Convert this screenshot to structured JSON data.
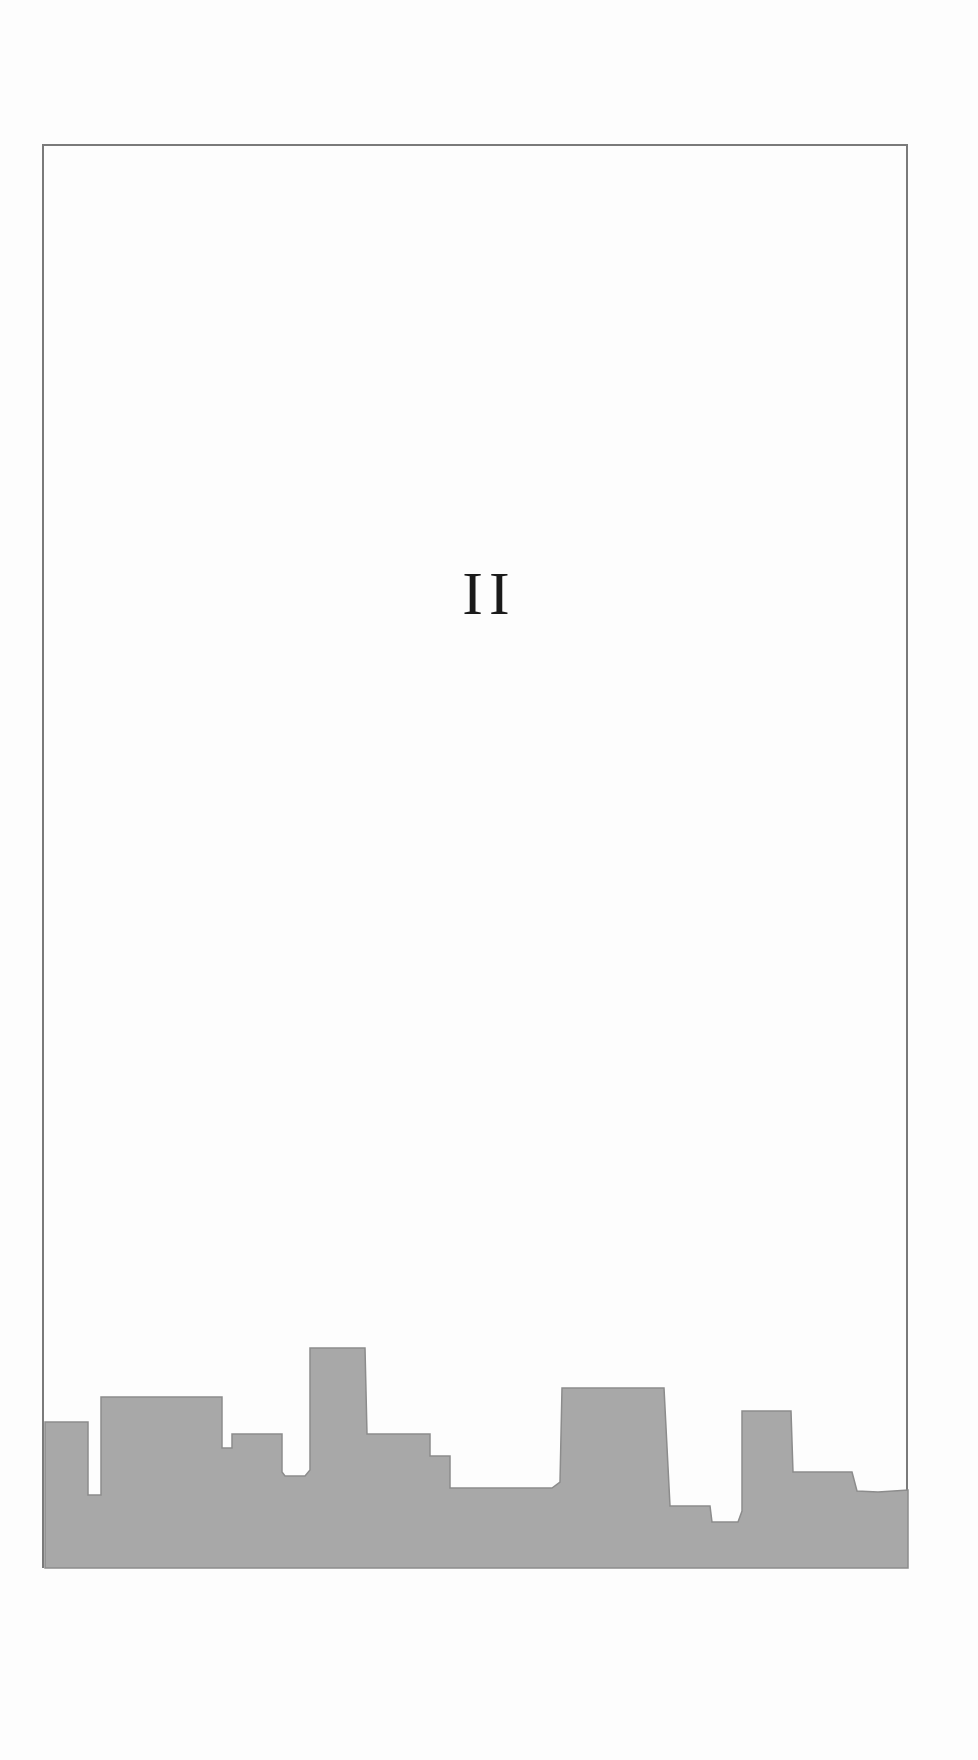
{
  "page": {
    "part_number": "II",
    "frame_color": "#7a7a7a",
    "skyline_color": "#a8a8a8",
    "text_color": "#1a1a1a"
  },
  "decoration": {
    "type": "city-skyline-silhouette",
    "polygon_points": "45,1568 45,1422 88,1422 88,1495 101,1495 101,1397 222,1397 222,1448 232,1448 232,1434 282,1434 282,1472 285,1476 305,1476 310,1470 310,1348 365,1348 367,1434 430,1434 430,1456 450,1456 450,1488 475,1488 552,1488 560,1482 562,1388 664,1388 670,1506 710,1506 712,1522 738,1522 742,1511 742,1411 791,1411 793,1472 852,1472 857,1491 878,1492 908,1490 908,1568"
  }
}
